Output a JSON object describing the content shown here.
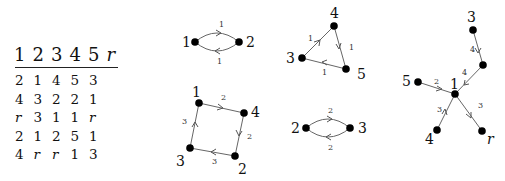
{
  "table": {
    "headers": [
      "1",
      "2",
      "3",
      "4",
      "5",
      "r"
    ],
    "rows": [
      [
        "2",
        "1",
        "4",
        "5",
        "3"
      ],
      [
        "4",
        "3",
        "2",
        "2",
        "1"
      ],
      [
        "r",
        "3",
        "1",
        "1",
        "r"
      ],
      [
        "2",
        "1",
        "2",
        "5",
        "1"
      ],
      [
        "4",
        "r",
        "r",
        "1",
        "3"
      ]
    ]
  },
  "graphs": {
    "g12": {
      "nodes": [
        "1",
        "2"
      ],
      "edge_top": "1",
      "edge_bottom": "1"
    },
    "g1423": {
      "nodes": [
        "1",
        "4",
        "2",
        "3"
      ],
      "e14": "2",
      "e42": "2",
      "e23": "3",
      "e31": "3"
    },
    "g345": {
      "nodes": [
        "4",
        "3",
        "5"
      ],
      "e34": "1",
      "e45": "1",
      "e53": "1"
    },
    "g23": {
      "nodes": [
        "2",
        "3"
      ],
      "edge_top": "2",
      "edge_bottom": "2"
    },
    "star": {
      "nodes": [
        "3",
        "5",
        "1",
        "4",
        "r"
      ],
      "e3m": "4",
      "em1": "4",
      "e51": "2",
      "e41": "3",
      "e1r": "3"
    }
  }
}
